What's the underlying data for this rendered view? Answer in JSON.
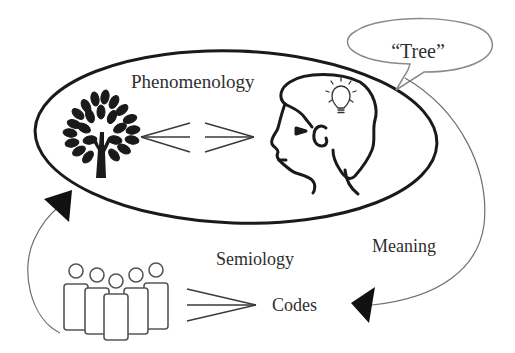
{
  "diagram": {
    "labels": {
      "phenomenology": "Phenomenology",
      "speech": "“Tree”",
      "meaning": "Meaning",
      "semiology": "Semiology",
      "codes": "Codes"
    },
    "icons": {
      "tree": "tree-icon",
      "head": "human-head-profile-icon",
      "idea": "lightbulb-icon",
      "group": "group-of-people-icon",
      "bidirectional": "double-arrow-icon",
      "convergence": "convergence-arrow-icon"
    },
    "colors": {
      "stroke": "#1a1a1a",
      "thin_stroke": "#6e6e6e",
      "text": "#2f2f2f",
      "background": "#ffffff"
    }
  }
}
